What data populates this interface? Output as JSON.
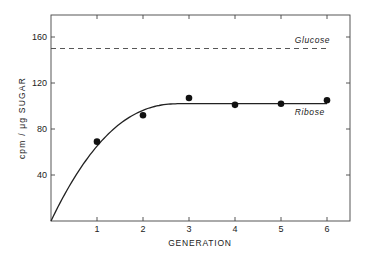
{
  "chart_data": {
    "type": "line",
    "title": "",
    "xlabel": "GENERATION",
    "ylabel": "cpm / μg SUGAR",
    "xlim": [
      0,
      6.5
    ],
    "ylim": [
      0,
      180
    ],
    "x_ticks": [
      1,
      2,
      3,
      4,
      5,
      6
    ],
    "x_tick_labels": [
      "1",
      "2",
      "3",
      "4",
      "5",
      "6"
    ],
    "y_ticks": [
      40,
      80,
      120,
      160
    ],
    "y_tick_labels": [
      "40",
      "80",
      "120",
      "160"
    ],
    "grid": false,
    "legend": null,
    "series": [
      {
        "name": "Ribose",
        "style": "points + fitted solid curve",
        "x": [
          1,
          2,
          3,
          4,
          5,
          6
        ],
        "values": [
          69,
          92,
          107,
          101,
          102,
          105
        ],
        "curve": {
          "type": "saturating",
          "start": [
            0,
            0
          ],
          "plateau": 102
        }
      },
      {
        "name": "Glucose",
        "style": "dashed horizontal line",
        "x": [
          0,
          6
        ],
        "values": [
          150,
          150
        ]
      }
    ],
    "annotations": [
      {
        "text": "Glucose",
        "x": 5.3,
        "y": 155
      },
      {
        "text": "Ribose",
        "x": 5.3,
        "y": 92
      }
    ]
  }
}
